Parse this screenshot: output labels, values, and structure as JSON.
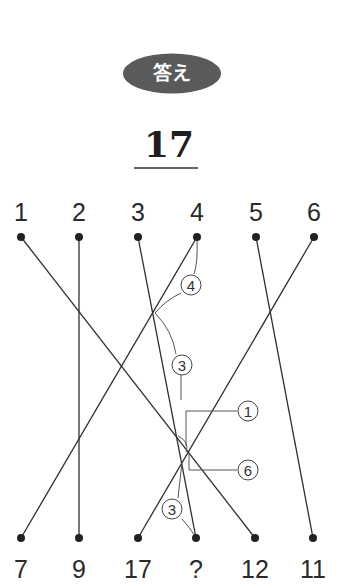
{
  "header": {
    "badge_label": "答え",
    "badge_color": "#5a5a5a",
    "answer": "17"
  },
  "diagram": {
    "top_labels": [
      "1",
      "2",
      "3",
      "4",
      "5",
      "6"
    ],
    "bottom_labels": [
      "7",
      "9",
      "17",
      "?",
      "12",
      "11"
    ],
    "top_x": [
      21,
      79,
      138,
      197,
      256,
      314
    ],
    "bottom_x": [
      21,
      79,
      138,
      196,
      255,
      313
    ],
    "connections": [
      {
        "from": "1",
        "to": "12"
      },
      {
        "from": "2",
        "to": "9"
      },
      {
        "from": "3",
        "to": "?"
      },
      {
        "from": "4",
        "to": "7"
      },
      {
        "from": "5",
        "to": "11"
      },
      {
        "from": "6",
        "to": "17"
      }
    ],
    "annotations": [
      {
        "label": "4"
      },
      {
        "label": "3"
      },
      {
        "label": "1"
      },
      {
        "label": "6"
      },
      {
        "label": "3"
      }
    ],
    "line_color": "#2f2f2f"
  }
}
